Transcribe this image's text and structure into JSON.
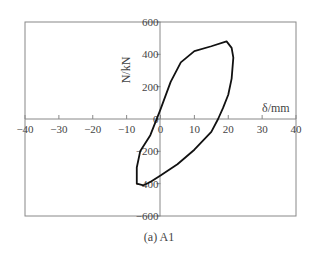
{
  "chart_data": {
    "type": "line",
    "title": "",
    "caption": "(a) A1",
    "xlabel": "δ/mm",
    "ylabel": "N/kN",
    "xlim": [
      -40,
      40
    ],
    "ylim": [
      -600,
      600
    ],
    "x_ticks": [
      "−40",
      "−30",
      "−20",
      "−10",
      "0",
      "10",
      "20",
      "30",
      "40"
    ],
    "y_ticks": [
      "600",
      "400",
      "200",
      "0",
      "−200",
      "−400",
      "−600"
    ],
    "grid": false,
    "series": [
      {
        "name": "hysteresis loop A1",
        "points": [
          [
            -3,
            -100
          ],
          [
            0,
            60
          ],
          [
            3,
            230
          ],
          [
            6,
            350
          ],
          [
            10,
            420
          ],
          [
            15,
            450
          ],
          [
            19.5,
            480
          ],
          [
            21,
            440
          ],
          [
            21.5,
            380
          ],
          [
            21,
            250
          ],
          [
            20,
            150
          ],
          [
            18.5,
            70
          ],
          [
            17,
            0
          ],
          [
            15,
            -80
          ],
          [
            10,
            -190
          ],
          [
            5,
            -280
          ],
          [
            0,
            -350
          ],
          [
            -3,
            -390
          ],
          [
            -5,
            -410
          ],
          [
            -7,
            -400
          ],
          [
            -7,
            -300
          ],
          [
            -6,
            -200
          ],
          [
            -3,
            -100
          ]
        ]
      }
    ]
  }
}
